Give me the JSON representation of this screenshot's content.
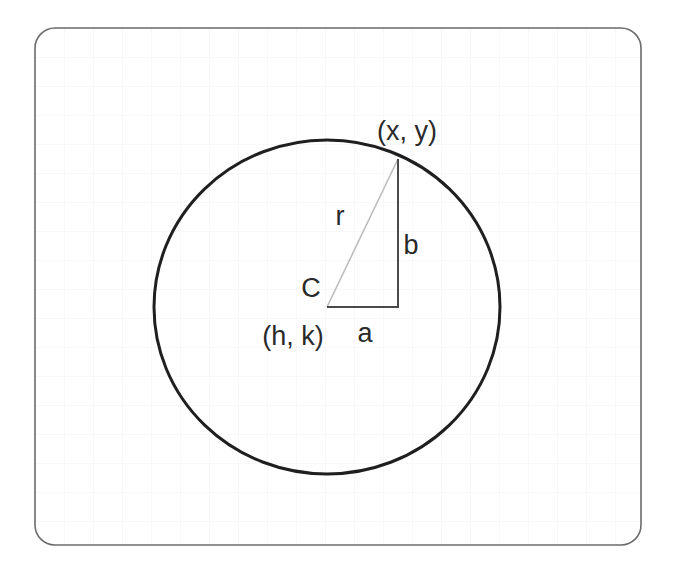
{
  "diagram": {
    "frame": {
      "x": 35,
      "y": 28,
      "width": 606,
      "height": 517,
      "radius": 20,
      "stroke": "#6b6b6b"
    },
    "grid": {
      "spacing": 29,
      "color": "#f3f3f3"
    },
    "circle": {
      "cx": 327,
      "cy": 307,
      "rx": 173,
      "ry": 167,
      "stroke": "#1f1f1f",
      "stroke_width": 3
    },
    "triangle": {
      "center": {
        "x": 327,
        "y": 307
      },
      "point": {
        "x": 398,
        "y": 159
      },
      "corner": {
        "x": 398,
        "y": 307
      },
      "leg_color": "#4a4a4a",
      "hypotenuse_color": "#bdbdbd"
    },
    "labels": {
      "point": "(x, y)",
      "radius": "r",
      "vertical_leg": "b",
      "horizontal_leg": "a",
      "center_name": "C",
      "center_coords": "(h, k)"
    }
  }
}
